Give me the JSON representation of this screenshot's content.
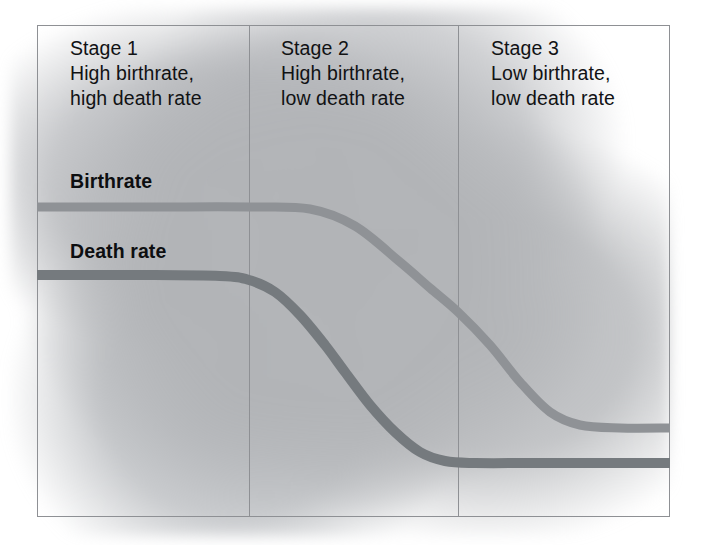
{
  "figure": {
    "frame": {
      "left": 37,
      "top": 25,
      "right": 670,
      "bottom": 517
    },
    "dividers": [
      249,
      458
    ]
  },
  "stages": [
    {
      "name": "Stage 1",
      "desc_line_1": "High birthrate,",
      "desc_line_2": "high death rate"
    },
    {
      "name": "Stage 2",
      "desc_line_1": "High birthrate,",
      "desc_line_2": "low death rate"
    },
    {
      "name": "Stage 3",
      "desc_line_1": "Low birthrate,",
      "desc_line_2": "low death rate"
    }
  ],
  "curve_labels": {
    "birthrate": "Birthrate",
    "death_rate": "Death rate"
  },
  "colors": {
    "birthrate_line": "#8f9296",
    "death_rate_line": "#757a7e",
    "frame_line": "#8e9094",
    "background_blob": "#b2b4b7",
    "page_background": "#ffffff",
    "text": "#111214"
  },
  "chart_data": {
    "type": "line",
    "xlabel": "",
    "ylabel": "",
    "grid": false,
    "legend": "inline-labels",
    "axis_ticks": false,
    "x_stage_boundaries": [
      249,
      458
    ],
    "stage_ranges": [
      {
        "stage": "Stage 1",
        "x_start": 37,
        "x_end": 249
      },
      {
        "stage": "Stage 2",
        "x_start": 249,
        "x_end": 458
      },
      {
        "stage": "Stage 3",
        "x_start": 458,
        "x_end": 670
      }
    ],
    "series": [
      {
        "name": "Birthrate",
        "color": "#8f9296",
        "stroke_width": 9,
        "description": "Stays high through Stage 1 and most of Stage 2, then falls steeply across the Stage 2/3 boundary and levels off low in Stage 3.",
        "plateau_high_y": 207,
        "plateau_low_y": 428,
        "points": [
          {
            "x": 37,
            "y": 207
          },
          {
            "x": 150,
            "y": 207
          },
          {
            "x": 249,
            "y": 207
          },
          {
            "x": 310,
            "y": 209
          },
          {
            "x": 355,
            "y": 226
          },
          {
            "x": 400,
            "y": 262
          },
          {
            "x": 430,
            "y": 288
          },
          {
            "x": 458,
            "y": 312
          },
          {
            "x": 490,
            "y": 345
          },
          {
            "x": 520,
            "y": 382
          },
          {
            "x": 550,
            "y": 412
          },
          {
            "x": 580,
            "y": 425
          },
          {
            "x": 620,
            "y": 428
          },
          {
            "x": 670,
            "y": 428
          }
        ]
      },
      {
        "name": "Death rate",
        "color": "#757a7e",
        "stroke_width": 10,
        "description": "Stays high through Stage 1, drops steeply through Stage 2, then levels off low at the start of Stage 3.",
        "plateau_high_y": 275,
        "plateau_low_y": 463,
        "points": [
          {
            "x": 37,
            "y": 275
          },
          {
            "x": 140,
            "y": 275
          },
          {
            "x": 220,
            "y": 276
          },
          {
            "x": 249,
            "y": 280
          },
          {
            "x": 275,
            "y": 292
          },
          {
            "x": 300,
            "y": 315
          },
          {
            "x": 325,
            "y": 345
          },
          {
            "x": 345,
            "y": 372
          },
          {
            "x": 370,
            "y": 405
          },
          {
            "x": 395,
            "y": 432
          },
          {
            "x": 420,
            "y": 452
          },
          {
            "x": 445,
            "y": 461
          },
          {
            "x": 475,
            "y": 463
          },
          {
            "x": 540,
            "y": 463
          },
          {
            "x": 670,
            "y": 463
          }
        ]
      }
    ]
  }
}
